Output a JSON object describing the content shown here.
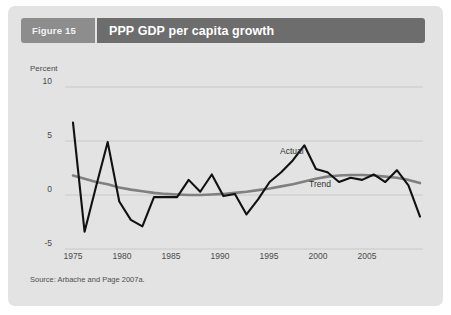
{
  "figure": {
    "number_label": "Figure 15",
    "title": "PPP GDP per capita growth",
    "source": "Source: Arbache and Page 2007a."
  },
  "colors": {
    "panel_bg": "#e3e3e3",
    "header_num_bg": "#8d8d8d",
    "header_title_bg": "#6d6d6d",
    "actual_line": "#111111",
    "trend_line": "#808080",
    "gridline": "#c8c8c8",
    "text": "#4a4a4a"
  },
  "chart_data": {
    "type": "line",
    "title": "PPP GDP per capita growth",
    "xlabel": "",
    "ylabel": "Percent",
    "ylim": [
      -5,
      10
    ],
    "xlim": [
      1975,
      2005
    ],
    "grid": true,
    "legend_position": "inline-annotation",
    "ytick_labels": [
      "10",
      "5",
      "0",
      "-5"
    ],
    "ytick_values": [
      10,
      5,
      0,
      -5
    ],
    "xtick_labels": [
      "1975",
      "1980",
      "1985",
      "1990",
      "1995",
      "2000",
      "2005"
    ],
    "xtick_values": [
      1975,
      1980,
      1985,
      1990,
      1995,
      2000,
      2005
    ],
    "x": [
      1975,
      1976,
      1977,
      1978,
      1979,
      1980,
      1981,
      1982,
      1983,
      1984,
      1985,
      1986,
      1987,
      1988,
      1989,
      1990,
      1991,
      1992,
      1993,
      1994,
      1995,
      1996,
      1997,
      1998,
      1999,
      2000,
      2001,
      2002,
      2003,
      2004,
      2005
    ],
    "series": [
      {
        "name": "Actual",
        "color": "#111111",
        "values": [
          6.7,
          -3.4,
          0.8,
          4.9,
          -0.6,
          -2.3,
          -2.9,
          -0.2,
          -0.2,
          -0.2,
          1.4,
          0.3,
          1.9,
          -0.1,
          0.1,
          -1.8,
          -0.4,
          1.2,
          2.1,
          3.2,
          4.6,
          2.4,
          2.1,
          1.2,
          1.6,
          1.4,
          1.9,
          1.2,
          2.3,
          0.9,
          -2.0
        ]
      },
      {
        "name": "Trend",
        "color": "#808080",
        "values": [
          1.8,
          1.5,
          1.2,
          1.0,
          0.7,
          0.5,
          0.35,
          0.2,
          0.1,
          0.05,
          0.0,
          0.0,
          0.05,
          0.1,
          0.2,
          0.3,
          0.45,
          0.6,
          0.8,
          1.0,
          1.25,
          1.5,
          1.7,
          1.8,
          1.85,
          1.85,
          1.8,
          1.7,
          1.6,
          1.4,
          1.1
        ]
      }
    ],
    "annotations": [
      {
        "text": "Actual",
        "x": 1996,
        "y": 4.0
      },
      {
        "text": "Trend",
        "x": 1998,
        "y": 0.9
      }
    ]
  }
}
